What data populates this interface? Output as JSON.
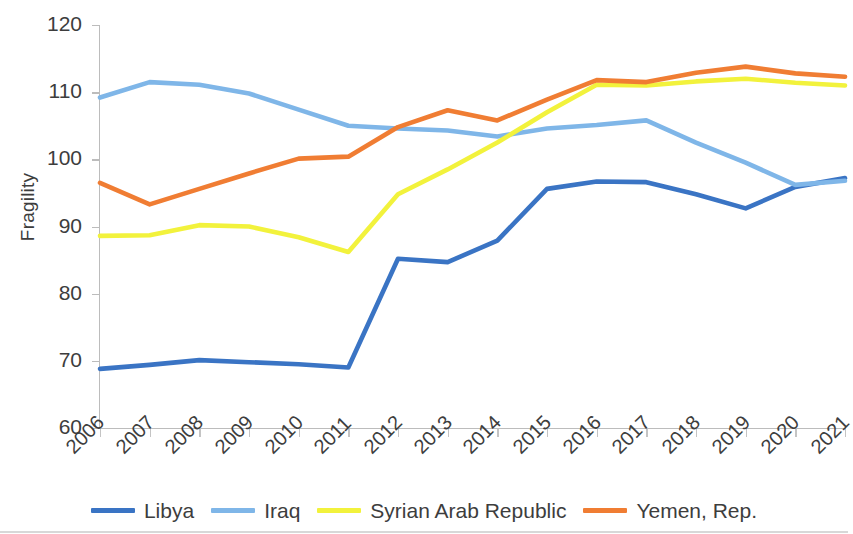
{
  "chart_data": {
    "type": "line",
    "title": "",
    "xlabel": "",
    "ylabel": "Fragility",
    "ylim": [
      60,
      120
    ],
    "yticks": [
      60,
      70,
      80,
      90,
      100,
      110,
      120
    ],
    "grid": false,
    "legend_position": "bottom",
    "categories": [
      "2006",
      "2007",
      "2008",
      "2009",
      "2010",
      "2011",
      "2012",
      "2013",
      "2014",
      "2015",
      "2016",
      "2017",
      "2018",
      "2019",
      "2020",
      "2021"
    ],
    "series": [
      {
        "name": "Libya",
        "color": "#3A74C4",
        "values": [
          68.8,
          69.4,
          70.1,
          69.8,
          69.5,
          69.0,
          85.2,
          84.7,
          87.9,
          95.6,
          96.7,
          96.6,
          94.8,
          92.7,
          95.9,
          97.2
        ]
      },
      {
        "name": "Iraq",
        "color": "#7FB6E8",
        "values": [
          109.2,
          111.5,
          111.1,
          109.8,
          107.4,
          105.0,
          104.6,
          104.3,
          103.4,
          104.6,
          105.1,
          105.8,
          102.5,
          99.5,
          96.2,
          96.8
        ]
      },
      {
        "name": "Syrian Arab Republic",
        "color": "#F2F23C",
        "values": [
          88.6,
          88.7,
          90.2,
          90.0,
          88.4,
          86.2,
          94.8,
          98.5,
          102.5,
          107.0,
          111.1,
          111.0,
          111.6,
          112.0,
          111.4,
          111.0
        ]
      },
      {
        "name": "Yemen, Rep.",
        "color": "#F07D33",
        "values": [
          96.5,
          93.3,
          95.6,
          97.9,
          100.1,
          100.4,
          104.8,
          107.3,
          105.8,
          108.9,
          111.8,
          111.5,
          112.9,
          113.8,
          112.8,
          112.3
        ]
      }
    ]
  },
  "legend": {
    "items": [
      {
        "label": "Libya",
        "color": "#3A74C4"
      },
      {
        "label": "Iraq",
        "color": "#7FB6E8"
      },
      {
        "label": "Syrian Arab Republic",
        "color": "#F2F23C"
      },
      {
        "label": "Yemen, Rep.",
        "color": "#F07D33"
      }
    ]
  }
}
